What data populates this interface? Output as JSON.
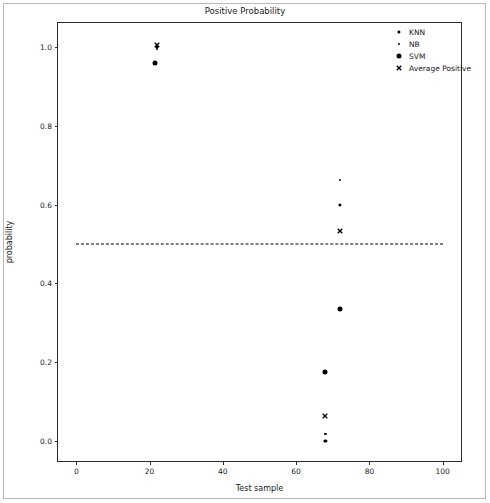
{
  "chart_data": {
    "type": "scatter",
    "title": "Positive Probability",
    "xlabel": "Test sample",
    "ylabel": "probability",
    "xlim": [
      -5,
      105
    ],
    "ylim": [
      -0.05,
      1.06
    ],
    "xticks": [
      "0",
      "20",
      "40",
      "60",
      "80",
      "100"
    ],
    "xtick_values": [
      0,
      20,
      40,
      60,
      80,
      100
    ],
    "yticks": [
      "0.0",
      "0.2",
      "0.4",
      "0.6",
      "0.8",
      "1.0"
    ],
    "ytick_values": [
      0.0,
      0.2,
      0.4,
      0.6,
      0.8,
      1.0
    ],
    "grid": false,
    "legend_position": "upper right",
    "threshold": {
      "value": 0.5,
      "style": "dashed",
      "color": "#000000",
      "x_start": 0,
      "x_end": 100
    },
    "series": [
      {
        "name": "KNN",
        "marker": "dot",
        "marker_size": 3.2,
        "color": "#000000",
        "points": [
          {
            "x": 22,
            "y": 1.0
          },
          {
            "x": 72,
            "y": 0.6
          },
          {
            "x": 68,
            "y": 0.0
          }
        ]
      },
      {
        "name": "NB",
        "marker": "dot",
        "marker_size": 2.2,
        "color": "#000000",
        "points": [
          {
            "x": 22,
            "y": 0.995
          },
          {
            "x": 72,
            "y": 0.662
          },
          {
            "x": 68,
            "y": 0.018
          }
        ]
      },
      {
        "name": "SVM",
        "marker": "dot",
        "marker_size": 5.0,
        "color": "#000000",
        "points": [
          {
            "x": 21.5,
            "y": 0.958
          },
          {
            "x": 72,
            "y": 0.335
          },
          {
            "x": 68,
            "y": 0.175
          }
        ]
      },
      {
        "name": "Average Positive",
        "marker": "x",
        "marker_size": 6.0,
        "color": "#000000",
        "points": [
          {
            "x": 22,
            "y": 1.005
          },
          {
            "x": 72,
            "y": 0.532
          },
          {
            "x": 68,
            "y": 0.065
          }
        ]
      }
    ]
  }
}
